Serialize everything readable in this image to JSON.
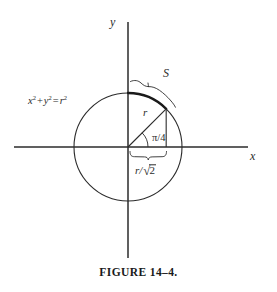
{
  "figure": {
    "caption": "FIGURE 14–4.",
    "axes": {
      "y_label": "y",
      "x_label": "x"
    },
    "labels": {
      "arc_length": "S",
      "radius": "r",
      "angle": "π/4",
      "circle_equation_x": "x",
      "circle_equation_y": "y",
      "circle_equation_r": "r",
      "circle_equation_exponent": "2",
      "circle_equation_plus": "+",
      "circle_equation_equals": "=",
      "half_chord_numerator": "r",
      "half_chord_slash": "/",
      "half_chord_radical": "√",
      "half_chord_radicand": "2"
    },
    "geometry": {
      "origin_x": 128,
      "origin_y": 147,
      "radius_px": 54,
      "angle_degrees": 45,
      "x_axis_start": 14,
      "x_axis_end": 248,
      "y_axis_start": 22,
      "y_axis_end": 258,
      "point_45_x": 166,
      "point_45_y": 109
    },
    "colors": {
      "stroke": "#2b2b2b",
      "background": "#ffffff",
      "arc_highlight": "#1a1a1a"
    }
  }
}
